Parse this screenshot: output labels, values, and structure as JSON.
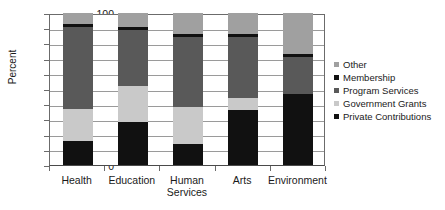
{
  "chart_data": {
    "type": "bar",
    "subtype": "stacked-bar",
    "title": "",
    "xlabel": "",
    "ylabel": "Percent",
    "ylim": [
      0,
      100
    ],
    "yticks": [
      0,
      10,
      20,
      30,
      40,
      50,
      60,
      70,
      80,
      90,
      100
    ],
    "ytick_labels": [
      "0",
      "10",
      "20",
      "30",
      "40",
      "50",
      "60",
      "70",
      "80",
      "90",
      "100"
    ],
    "grid": true,
    "legend_position": "right",
    "categories": [
      "Health",
      "Education",
      "Human Services",
      "Arts",
      "Environment"
    ],
    "category_labels": [
      [
        "Health"
      ],
      [
        "Education"
      ],
      [
        "Human",
        "Services"
      ],
      [
        "Arts"
      ],
      [
        "Environment"
      ]
    ],
    "stack_order_bottom_to_top": [
      "Private Contributions",
      "Government Grants",
      "Program Services",
      "Membership",
      "Other"
    ],
    "series": [
      {
        "name": "Private Contributions",
        "color": "#111111",
        "values": [
          16,
          28,
          14,
          36,
          47
        ]
      },
      {
        "name": "Government Grants",
        "color": "#c9c9c9",
        "values": [
          21,
          24,
          24,
          8,
          0
        ]
      },
      {
        "name": "Program Services",
        "color": "#595959",
        "values": [
          54,
          37,
          46,
          40,
          24
        ]
      },
      {
        "name": "Membership",
        "color": "#111111",
        "values": [
          2,
          2,
          2,
          2,
          2
        ]
      },
      {
        "name": "Other",
        "color": "#a0a0a0",
        "values": [
          7,
          9,
          14,
          14,
          27
        ]
      }
    ],
    "legend_entries": [
      {
        "label": "Other",
        "color": "#a0a0a0"
      },
      {
        "label": "Membership",
        "color": "#111111"
      },
      {
        "label": "Program Services",
        "color": "#595959"
      },
      {
        "label": "Government Grants",
        "color": "#c9c9c9"
      },
      {
        "label": "Private Contributions",
        "color": "#111111"
      }
    ]
  }
}
